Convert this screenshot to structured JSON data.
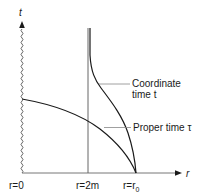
{
  "diagram": {
    "axes": {
      "y_label": "t",
      "x_label": "r"
    },
    "ticks": {
      "r0": "r=0",
      "r2m": "r=2m",
      "rr0_prefix": "r=r",
      "rr0_sub": "0"
    },
    "curves": {
      "coordinate_label_line1": "Coordinate",
      "coordinate_label_line2": "time t",
      "proper_label": "Proper time τ"
    },
    "colors": {
      "ink": "#1a1a1a",
      "leader": "#777777"
    }
  }
}
